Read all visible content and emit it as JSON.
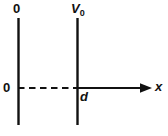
{
  "figure": {
    "kind": "potential-step-diagram",
    "background_color": "#ffffff",
    "stroke_color": "#111111",
    "labels": {
      "barrier_top": "V",
      "barrier_top_subscript": "0",
      "well_top": "0",
      "origin": "0",
      "width": "d",
      "axis_x": "x"
    },
    "geometry": {
      "left_wall_x": 18,
      "right_wall_x": 77,
      "wall_top_y": 18,
      "wall_bottom_y": 125,
      "axis_y": 88,
      "axis_end_x": 152,
      "dashed_start_x": 18,
      "dashed_end_x": 77,
      "line_width": 2
    }
  }
}
